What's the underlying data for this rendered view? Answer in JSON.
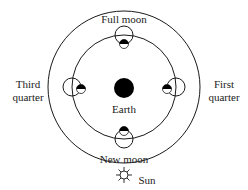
{
  "diagram": {
    "center": {
      "label": "Earth"
    },
    "sun": {
      "label": "Sun"
    },
    "phases": [
      {
        "id": "full",
        "label": "Full moon",
        "position": "top"
      },
      {
        "id": "first",
        "label_line1": "First",
        "label_line2": "quarter",
        "position": "right"
      },
      {
        "id": "new",
        "label": "New moon",
        "position": "bottom"
      },
      {
        "id": "third",
        "label_line1": "Third",
        "label_line2": "quarter",
        "position": "left"
      }
    ],
    "colors": {
      "stroke": "#1a1a1a",
      "fill_dark": "#000000",
      "fill_light": "#ffffff"
    }
  }
}
